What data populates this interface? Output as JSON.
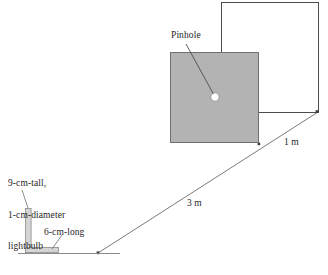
{
  "figure": {
    "background_color": "#ffffff",
    "stroke_color": "#4d4d4d",
    "barrier_fill_color": "#b3b3b3",
    "pinhole_fill_color": "#ffffff",
    "labels": {
      "pinhole": "Pinhole",
      "bulb_line1": "9-cm-tall,",
      "bulb_line2": "1-cm-diameter",
      "bulb_line3": "lightbulb",
      "bulb_full": "9-cm-tall, 1-cm-diameter lightbulb",
      "six_cm_long": "6-cm-long",
      "three_m": "3 m",
      "one_m": "1 m"
    },
    "measurements": [
      {
        "name": "bulb-height",
        "value": "9-cm-tall"
      },
      {
        "name": "bulb-diameter",
        "value": "1-cm-diameter"
      },
      {
        "name": "base-length",
        "value": "6-cm-long"
      },
      {
        "name": "bulb-to-pinhole-distance",
        "value": "3 m"
      },
      {
        "name": "pinhole-to-screen-distance",
        "value": "1 m"
      }
    ],
    "elements": [
      {
        "name": "screen-rectangle",
        "kind": "outlined-rectangle"
      },
      {
        "name": "barrier-square",
        "kind": "gray-filled-square"
      },
      {
        "name": "pinhole-aperture",
        "kind": "small-white-circle"
      },
      {
        "name": "lightbulb-shape",
        "kind": "L-shaped-bar"
      },
      {
        "name": "ground-line",
        "kind": "horizontal-line"
      },
      {
        "name": "light-ray",
        "kind": "diagonal-line"
      }
    ]
  }
}
